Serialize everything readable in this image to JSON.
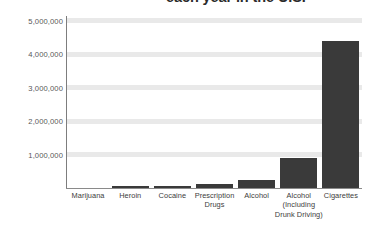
{
  "chart_data": {
    "type": "bar",
    "title": "each year in the U.S.",
    "title_truncated": true,
    "xlabel": "",
    "ylabel": "",
    "categories": [
      "Marijuana",
      "Heroin",
      "Cocaine",
      "Prescription Drugs",
      "Alcohol",
      "Alcohol (Including Drunk Driving)",
      "Cigarettes"
    ],
    "category_lines": [
      [
        "Marijuana"
      ],
      [
        "Heroin"
      ],
      [
        "Cocaine"
      ],
      [
        "Prescription",
        "Drugs"
      ],
      [
        "Alcohol"
      ],
      [
        "Alcohol",
        "(Including",
        "Drunk Driving)"
      ],
      [
        "Cigarettes"
      ]
    ],
    "values": [
      0,
      50000,
      60000,
      120000,
      250000,
      900000,
      4400000
    ],
    "ylim": [
      0,
      5200000
    ],
    "ytick_values": [
      1000000,
      2000000,
      3000000,
      4000000,
      5000000
    ],
    "ytick_labels": [
      "1,000,000",
      "2,000,000",
      "3,000,000",
      "4,000,000",
      "5,000,000"
    ],
    "grid": true,
    "legend": "none",
    "series_name": "Deaths per year",
    "bar_color": "#3a3a3a",
    "gridline_color": "#e9e9e9",
    "axis_color": "#7d7d7d",
    "background_color": "#ffffff"
  }
}
